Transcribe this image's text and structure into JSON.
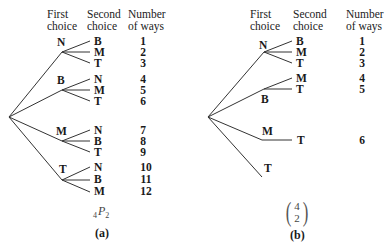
{
  "headers": {
    "first_choice": [
      "First",
      "choice"
    ],
    "second_choice": [
      "Second",
      "choice"
    ],
    "number_of_ways": [
      "Number",
      "of ways"
    ]
  },
  "panel_a": {
    "caption": "(a)",
    "formula": {
      "pre": "4",
      "symbol": "P",
      "sub": "2"
    },
    "first": [
      "N",
      "B",
      "M",
      "T"
    ],
    "second": [
      [
        "B",
        "M",
        "T"
      ],
      [
        "N",
        "M",
        "T"
      ],
      [
        "N",
        "B",
        "T"
      ],
      [
        "N",
        "B",
        "M"
      ]
    ],
    "ways": [
      "1",
      "2",
      "3",
      "4",
      "5",
      "6",
      "7",
      "8",
      "9",
      "10",
      "11",
      "12"
    ]
  },
  "panel_b": {
    "caption": "(b)",
    "formula": {
      "top": "4",
      "bottom": "2"
    },
    "first": [
      "N",
      "B",
      "M",
      "T"
    ],
    "second": [
      [
        "B",
        "M",
        "T"
      ],
      [
        "M",
        "T"
      ],
      [
        "T"
      ],
      []
    ],
    "ways": [
      "1",
      "2",
      "3",
      "4",
      "5",
      "6"
    ]
  }
}
